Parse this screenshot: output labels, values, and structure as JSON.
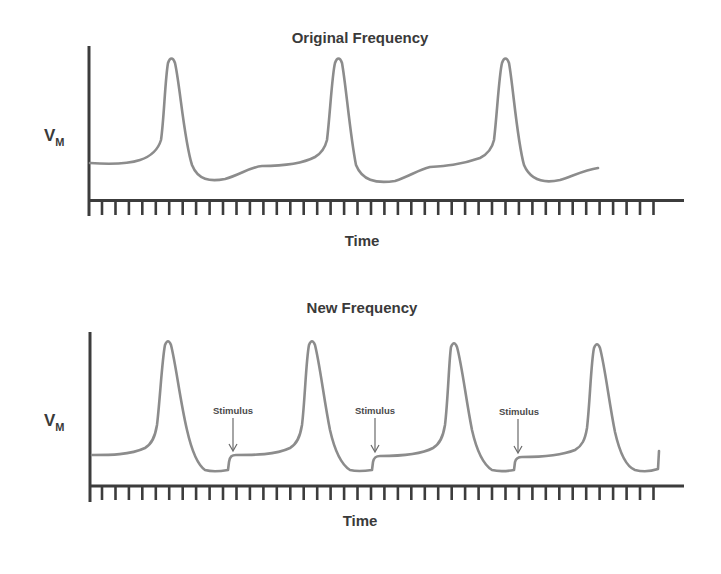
{
  "figure": {
    "top_panel": {
      "title": "Original Frequency",
      "ylabel_main": "V",
      "ylabel_sub": "M",
      "xlabel": "Time"
    },
    "bottom_panel": {
      "title": "New Frequency",
      "ylabel_main": "V",
      "ylabel_sub": "M",
      "xlabel": "Time",
      "annotations": [
        "Stimulus",
        "Stimulus",
        "Stimulus"
      ]
    },
    "colors": {
      "trace": "#8c8c8c",
      "axis": "#3c3c3c",
      "text": "#3a3a3a"
    }
  }
}
